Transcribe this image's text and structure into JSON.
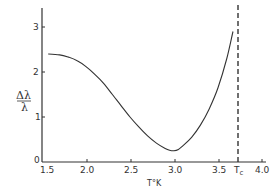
{
  "chart_data": {
    "type": "line",
    "title": "",
    "xlabel": "T°K",
    "ylabel_top": "Δλ",
    "ylabel_bottom": "λ",
    "xlim": [
      1.5,
      4.0
    ],
    "ylim": [
      0,
      3.4
    ],
    "x_ticks": [
      1.5,
      2.0,
      2.5,
      3.0,
      3.5,
      4.0
    ],
    "x_tick_labels": [
      "1.5",
      "2.0",
      "2.5",
      "3.0",
      "3.5",
      "4.0"
    ],
    "y_ticks": [
      0,
      1,
      2,
      3
    ],
    "y_tick_labels": [
      "0",
      "1",
      "2",
      "3"
    ],
    "grid": false,
    "legend": null,
    "annotations": [
      {
        "text": "Tc",
        "x": 3.73,
        "type": "vertical-dashed-line",
        "note": "critical temperature"
      }
    ],
    "series": [
      {
        "name": "Δλ/λ",
        "x": [
          1.57,
          1.7,
          1.8,
          1.9,
          2.0,
          2.1,
          2.2,
          2.3,
          2.4,
          2.5,
          2.6,
          2.7,
          2.8,
          2.9,
          2.95,
          3.0,
          3.05,
          3.1,
          3.2,
          3.3,
          3.4,
          3.5,
          3.6,
          3.67
        ],
        "values": [
          2.4,
          2.38,
          2.33,
          2.25,
          2.12,
          1.95,
          1.75,
          1.5,
          1.25,
          1.0,
          0.78,
          0.58,
          0.42,
          0.3,
          0.26,
          0.25,
          0.28,
          0.36,
          0.55,
          0.82,
          1.18,
          1.65,
          2.3,
          2.9
        ]
      }
    ]
  },
  "labels": {
    "y0": "0",
    "y1": "1",
    "y2": "2",
    "y3": "3",
    "x15": "1.5",
    "x20": "2.0",
    "x25": "2.5",
    "x30": "3.0",
    "x35": "3.5",
    "x40": "4.0",
    "tc_main": "T",
    "tc_sub": "c",
    "xlabel": "T°K",
    "ylab_top": "Δλ",
    "ylab_bottom": "λ"
  }
}
